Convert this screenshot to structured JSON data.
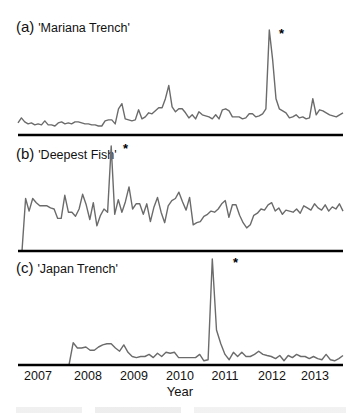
{
  "chart_data": [
    {
      "type": "line",
      "title": "(a) 'Mariana Trench'",
      "panel_letter": "(a)",
      "panel_name": "'Mariana Trench'",
      "xlabel": "Year",
      "ylabel": "",
      "x_range": [
        "2007-01",
        "2013-09"
      ],
      "ylim": [
        0,
        100
      ],
      "peak_marker": "*",
      "peak_month": "2012-01",
      "values": [
        8,
        13,
        9,
        7,
        8,
        6,
        7,
        6,
        10,
        6,
        6,
        5,
        8,
        9,
        7,
        8,
        7,
        9,
        9,
        8,
        7,
        7,
        6,
        6,
        5,
        5,
        10,
        11,
        11,
        7,
        22,
        27,
        12,
        11,
        10,
        11,
        21,
        12,
        14,
        18,
        17,
        20,
        23,
        23,
        32,
        45,
        24,
        19,
        22,
        22,
        18,
        13,
        16,
        12,
        19,
        16,
        15,
        14,
        12,
        16,
        12,
        21,
        22,
        20,
        14,
        14,
        14,
        12,
        13,
        17,
        17,
        14,
        15,
        17,
        22,
        100,
        71,
        32,
        22,
        20,
        18,
        13,
        14,
        16,
        13,
        14,
        12,
        13,
        32,
        16,
        21,
        20,
        18,
        16,
        15,
        14,
        16,
        18
      ],
      "months_per_point": 0.83
    },
    {
      "type": "line",
      "title": "(b) 'Deepest Fish'",
      "panel_letter": "(b)",
      "panel_name": "'Deepest Fish'",
      "xlabel": "Year",
      "ylim": [
        0,
        100
      ],
      "peak_marker": "*",
      "peak_month": "2008-09",
      "values": [
        0,
        50,
        38,
        50,
        46,
        43,
        43,
        43,
        41,
        40,
        31,
        31,
        53,
        37,
        37,
        33,
        40,
        54,
        44,
        30,
        46,
        24,
        34,
        40,
        37,
        100,
        35,
        49,
        37,
        47,
        61,
        40,
        45,
        45,
        35,
        45,
        28,
        42,
        51,
        37,
        27,
        43,
        48,
        50,
        56,
        47,
        39,
        51,
        25,
        27,
        28,
        33,
        35,
        38,
        37,
        40,
        45,
        48,
        32,
        44,
        44,
        34,
        27,
        22,
        25,
        34,
        36,
        40,
        39,
        44,
        46,
        38,
        41,
        35,
        39,
        38,
        37,
        40,
        36,
        43,
        41,
        39,
        45,
        41,
        39,
        44,
        38,
        42,
        40,
        45,
        38
      ]
    },
    {
      "type": "line",
      "title": "(c) 'Japan Trench'",
      "panel_letter": "(c)",
      "panel_name": "'Japan Trench'",
      "xlabel": "Year",
      "ylim": [
        0,
        100
      ],
      "peak_marker": "*",
      "peak_month": "2011-03",
      "values": [
        0,
        21,
        16,
        16,
        17,
        14,
        14,
        17,
        19,
        20,
        20,
        16,
        13,
        19,
        12,
        8,
        7,
        8,
        8,
        10,
        7,
        11,
        8,
        12,
        11,
        12,
        7,
        7,
        7,
        7,
        7,
        10,
        4,
        5,
        100,
        33,
        20,
        10,
        5,
        12,
        8,
        12,
        8,
        8,
        10,
        13,
        10,
        9,
        8,
        6,
        9,
        4,
        9,
        7,
        10,
        8,
        8,
        6,
        8,
        6,
        5,
        10,
        5,
        4,
        6,
        9
      ],
      "start_month": "2007-08"
    }
  ],
  "x_axis": {
    "label": "Year",
    "ticks": [
      "2007",
      "2008",
      "2009",
      "2010",
      "2011",
      "2012",
      "2013"
    ]
  },
  "panels": [
    {
      "letter": "(a)",
      "name": "'Mariana Trench'",
      "marker": "*"
    },
    {
      "letter": "(b)",
      "name": "'Deepest Fish'",
      "marker": "*"
    },
    {
      "letter": "(c)",
      "name": "'Japan Trench'",
      "marker": "*"
    }
  ],
  "colors": {
    "line": "#6b6b6b",
    "axis": "#000000",
    "text": "#111111"
  }
}
